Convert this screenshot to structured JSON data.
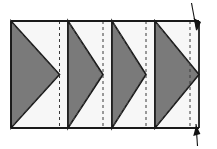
{
  "diagram": {
    "canvas": {
      "width": 217,
      "height": 149
    },
    "colors": {
      "background": "#ffffff",
      "fabric_light": "#F7F7F7",
      "fabric_dark": "#7A7A7A",
      "outline": "#1A1A1A",
      "stitch_line": "#3A3A3A",
      "pin": "#111111"
    },
    "strip": {
      "left": 11,
      "right": 199,
      "top": 21,
      "bottom": 128,
      "outline_width": 1.6
    },
    "blocks": [
      {
        "name": "block-1",
        "x": 11,
        "width": 57,
        "triangle_tip_y": 74.5,
        "seam_x": 59.5,
        "label": "Block 1"
      },
      {
        "name": "block-2",
        "x": 68,
        "width": 44,
        "triangle_tip_y": 74.5,
        "seam_x": 103,
        "label": "Block 2"
      },
      {
        "name": "block-3",
        "x": 112,
        "width": 43,
        "triangle_tip_y": 74.5,
        "seam_x": 146,
        "label": "Block 3"
      },
      {
        "name": "block-4",
        "x": 155,
        "width": 44,
        "triangle_tip_y": 74.5,
        "seam_x": 190,
        "label": "Block 4"
      }
    ],
    "seam_lines": [
      {
        "name": "seam-line-1",
        "x": 59.5
      },
      {
        "name": "seam-line-2",
        "x": 103
      },
      {
        "name": "seam-line-3",
        "x": 146
      },
      {
        "name": "seam-line-4",
        "x": 190
      }
    ],
    "stitch_dash": {
      "pattern": "3 3",
      "width": 1
    },
    "pins": [
      {
        "name": "pin-top-right",
        "x": 196,
        "y": 4,
        "angle": 20,
        "length": 26
      },
      {
        "name": "pin-bottom-right",
        "x": 196,
        "y": 126,
        "angle": 4,
        "length": 22
      }
    ]
  }
}
